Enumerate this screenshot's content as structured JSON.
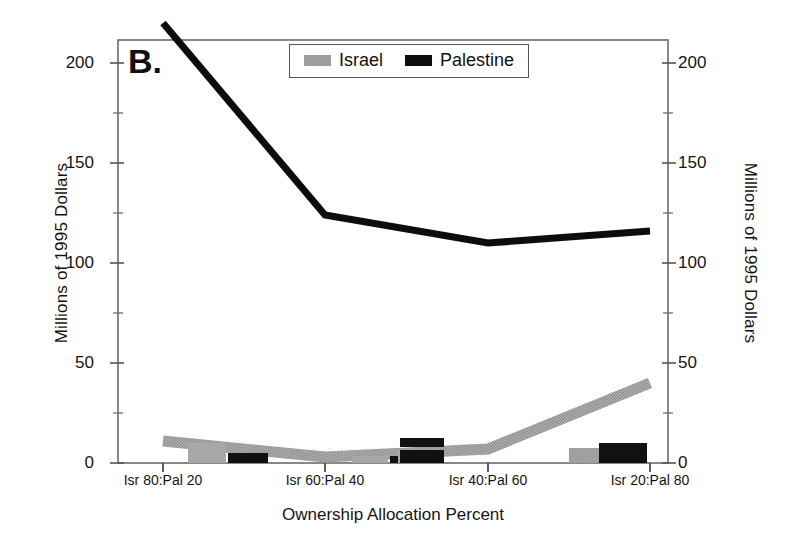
{
  "chart_data": {
    "type": "line",
    "title": "B.",
    "panel_label": "B.",
    "xlabel": "Ownership Allocation Percent",
    "ylabel": "Millions of 1995 Dollars",
    "ylabel_right": "Millions of 1995 Dollars",
    "categories": [
      "Isr 80:Pal 20",
      "Isr 60:Pal 40",
      "Isr 40:Pal 60",
      "Isr 20:Pal 80"
    ],
    "ylim": [
      0,
      220
    ],
    "ytick_values": [
      0,
      50,
      100,
      150,
      200
    ],
    "ytick_labels": [
      "0",
      "50",
      "100",
      "150",
      "200"
    ],
    "yminor_values": [
      25,
      75,
      125,
      175
    ],
    "grid": false,
    "legend_position": "top-center",
    "series": [
      {
        "name": "Israel",
        "color": "#a8a8a8",
        "pattern": "dotted-gray",
        "values": [
          11,
          3,
          7,
          40
        ]
      },
      {
        "name": "Palestine",
        "color": "#0d0d0d",
        "pattern": "solid-black",
        "values": [
          220,
          124,
          110,
          116
        ]
      }
    ],
    "markers": [
      {
        "series": "Israel",
        "category": "Isr 80:Pal 20",
        "value": 11
      },
      {
        "series": "Palestine",
        "category": "Isr 80:Pal 20",
        "value": 2
      },
      {
        "series": "Israel",
        "category": "Isr 60:Pal 40",
        "value": 3
      },
      {
        "series": "Palestine",
        "category": "Isr 60:Pal 40",
        "value": 2
      },
      {
        "series": "Israel",
        "category": "Isr 40:Pal 60",
        "value": 7
      },
      {
        "series": "Palestine",
        "category": "Isr 40:Pal 60",
        "value": 7
      },
      {
        "series": "Israel",
        "category": "Isr 20:Pal 80",
        "value": 4
      },
      {
        "series": "Palestine",
        "category": "Isr 20:Pal 80",
        "value": 6
      }
    ]
  },
  "legend": {
    "entries": [
      {
        "label": "Israel",
        "swatch": "israel"
      },
      {
        "label": "Palestine",
        "swatch": "palestine"
      }
    ]
  },
  "axes": {
    "left": {
      "title": "Millions of 1995 Dollars",
      "ticks": [
        "200",
        "150",
        "100",
        "50",
        "0"
      ]
    },
    "right": {
      "title": "Millions of 1995 Dollars",
      "ticks": [
        "200",
        "150",
        "100",
        "50",
        "0"
      ]
    },
    "bottom": {
      "title": "Ownership Allocation Percent",
      "ticks": [
        "Isr 80:Pal 20",
        "Isr 60:Pal 40",
        "Isr 40:Pal 60",
        "Isr 20:Pal 80"
      ]
    }
  }
}
